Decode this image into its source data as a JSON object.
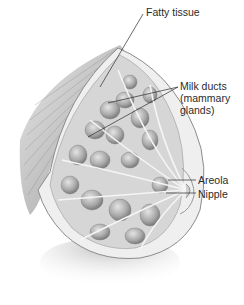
{
  "diagram": {
    "type": "anatomical-illustration",
    "labels": [
      {
        "id": "fatty-tissue",
        "text": "Fatty tissue",
        "x": 146,
        "y": 6
      },
      {
        "id": "milk-ducts",
        "lines": [
          "Milk ducts",
          "(mammary",
          "glands)"
        ],
        "x": 180,
        "y": 80
      },
      {
        "id": "areola",
        "text": "Areola",
        "x": 198,
        "y": 174
      },
      {
        "id": "nipple",
        "text": "Nipple",
        "x": 198,
        "y": 188
      }
    ],
    "leader_lines": [
      {
        "label": "fatty-tissue",
        "from": [
          143,
          14
        ],
        "to": [
          100,
          87
        ]
      },
      {
        "label": "milk-ducts",
        "from": [
          178,
          87
        ],
        "to": [
          108,
          103
        ]
      },
      {
        "label": "milk-ducts",
        "from": [
          178,
          87
        ],
        "to": [
          88,
          137
        ]
      },
      {
        "label": "areola",
        "from": [
          196,
          180
        ],
        "to": [
          168,
          180
        ]
      },
      {
        "label": "nipple",
        "from": [
          196,
          193
        ],
        "to": [
          166,
          193
        ]
      }
    ],
    "colors": {
      "background": "#ffffff",
      "ink": "#2b2b2b",
      "tissue_light": "#d9d9d9",
      "tissue_mid": "#a8a8a8",
      "tissue_dark": "#6e6e6e"
    }
  }
}
